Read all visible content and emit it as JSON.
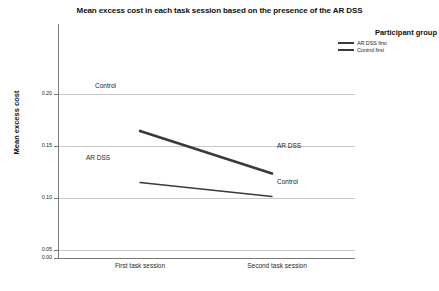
{
  "chart_data": {
    "type": "line",
    "title": "Mean excess cost in each task session based on the presence of the AR DSS",
    "xlabel": "",
    "ylabel": "Mean excess cost",
    "categories": [
      "First task session",
      "Second task session"
    ],
    "ylim": [
      0.0,
      0.2
    ],
    "yticks": [
      "0.00",
      "0.05",
      "0.10",
      "0.15",
      "0.20"
    ],
    "ytick_values": [
      0.0,
      0.05,
      0.1,
      0.15,
      0.2
    ],
    "grid": "horizontal",
    "legend_position": "top-right",
    "legend_title": "Participant group",
    "series": [
      {
        "name": "Control first",
        "values": [
          0.155,
          0.103
        ],
        "point_labels": [
          "Control",
          "AR DSS"
        ],
        "color": "#3a3a3a",
        "line_width": 2.6
      },
      {
        "name": "AR DSS first",
        "values": [
          0.092,
          0.075
        ],
        "point_labels": [
          "AR DSS",
          "Control"
        ],
        "color": "#3a3a3a",
        "line_width": 1.4
      }
    ]
  },
  "legend": {
    "title": "Participant group",
    "entries": [
      {
        "label": "AR DSS first",
        "style": "thin"
      },
      {
        "label": "Control first",
        "style": "thick"
      }
    ]
  },
  "axis": {
    "y_title": "Mean excess cost",
    "y_labels": [
      "0.20",
      "0.15",
      "0.10",
      "0.05",
      "0.00"
    ],
    "x_labels": [
      "First task session",
      "Second task session"
    ]
  },
  "annotations": {
    "upper_left": "Control",
    "upper_right": "AR DSS",
    "lower_left": "AR DSS",
    "lower_right": "Control"
  },
  "colors": {
    "series": "#3a3a3a",
    "grid": "#c9c9c9",
    "axis": "#7a7a7a",
    "text": "#1a1a1a",
    "background": "#ffffff"
  }
}
